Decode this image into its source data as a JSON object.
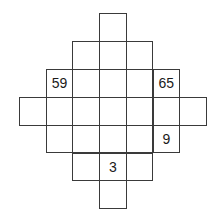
{
  "puzzle": {
    "origin": {
      "x": 19,
      "y": 13
    },
    "cell_w": 26.7,
    "cell_h": 27.9,
    "rows": [
      {
        "row": 0,
        "cells": [
          {
            "col": 3,
            "value": ""
          }
        ]
      },
      {
        "row": 1,
        "cells": [
          {
            "col": 2,
            "value": ""
          },
          {
            "col": 3,
            "value": ""
          },
          {
            "col": 4,
            "value": ""
          }
        ]
      },
      {
        "row": 2,
        "cells": [
          {
            "col": 1,
            "value": "59"
          },
          {
            "col": 2,
            "value": ""
          },
          {
            "col": 3,
            "value": ""
          },
          {
            "col": 4,
            "value": ""
          },
          {
            "col": 5,
            "value": "65"
          }
        ]
      },
      {
        "row": 3,
        "cells": [
          {
            "col": 0,
            "value": ""
          },
          {
            "col": 1,
            "value": ""
          },
          {
            "col": 2,
            "value": ""
          },
          {
            "col": 3,
            "value": ""
          },
          {
            "col": 4,
            "value": ""
          },
          {
            "col": 5,
            "value": ""
          },
          {
            "col": 6,
            "value": ""
          }
        ]
      },
      {
        "row": 4,
        "cells": [
          {
            "col": 1,
            "value": ""
          },
          {
            "col": 2,
            "value": ""
          },
          {
            "col": 3,
            "value": ""
          },
          {
            "col": 4,
            "value": ""
          },
          {
            "col": 5,
            "value": "9"
          }
        ]
      },
      {
        "row": 5,
        "cells": [
          {
            "col": 2,
            "value": ""
          },
          {
            "col": 3,
            "value": "3"
          },
          {
            "col": 4,
            "value": ""
          }
        ]
      },
      {
        "row": 6,
        "cells": [
          {
            "col": 3,
            "value": ""
          }
        ]
      }
    ]
  }
}
